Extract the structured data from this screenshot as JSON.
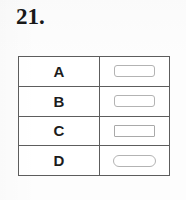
{
  "question": {
    "number_label": "21."
  },
  "answer_table": {
    "columns": [
      "option",
      "answer_box"
    ],
    "rows": [
      {
        "option": "A",
        "box_style": "rounded",
        "box_filled": false
      },
      {
        "option": "B",
        "box_style": "rounded",
        "box_filled": false
      },
      {
        "option": "C",
        "box_style": "square",
        "box_filled": false
      },
      {
        "option": "D",
        "box_style": "round",
        "box_filled": false
      }
    ]
  },
  "colors": {
    "page_background": "#fdfdfd",
    "table_border": "#5d5d5d",
    "box_border": "#b3b3b3",
    "text": "#1c1c1c",
    "number_text": "#181818"
  }
}
